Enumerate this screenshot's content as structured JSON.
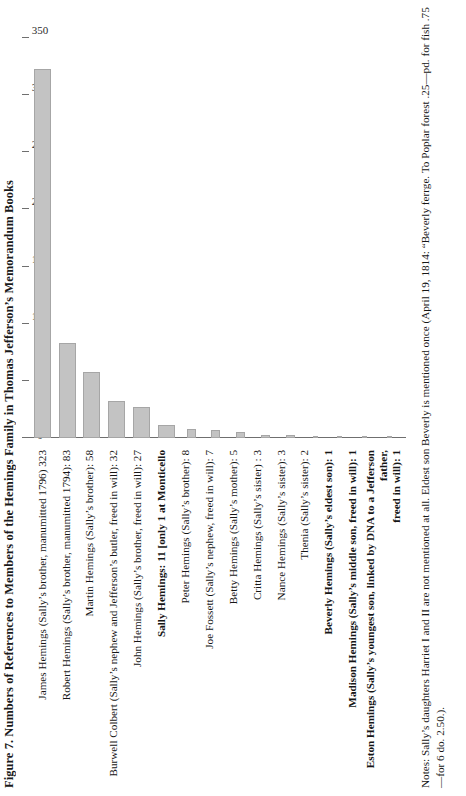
{
  "figure": {
    "title": "Figure 7. Numbers of References to Members of the Hemings Family in Thomas Jefferson’s Memorandum Books",
    "notes": "Notes: Sally’s daughters Harriet I and II are not mentioned at all. Eldest son Beverly is mentioned once (April 19, 1814: “Beverly ferrge. To Poplar forest .25—pd. for fish .75—for 6 do. 2.50.).",
    "bar_color": "#c3c3c3",
    "bar_border_color": "#a6a6a6",
    "axis_color": "#6f6f6f"
  },
  "chart_data": {
    "type": "bar",
    "orientation": "horizontal",
    "title": "Figure 7. Numbers of References to Members of the Hemings Family in Thomas Jefferson’s Memorandum Books",
    "xlabel": "",
    "ylabel": "",
    "xlim": [
      0,
      350
    ],
    "grid": false,
    "legend": false,
    "ticks": [
      0,
      50,
      100,
      150,
      200,
      250,
      300,
      350
    ],
    "categories": [
      "James Hemings (Sally’s brother, manumitted 1796)  323",
      "Robert Hemings (Sally’s brother, manumitted 1794): 83",
      "Martin Hemings (Sally’s brother): 58",
      "Burwell Colbert (Sally’s nephew and Jefferson’s butler, freed in will): 32",
      "John Hemings (Sally’s brother, freed in will): 27",
      "Sally Hemings: 11 [only 1 at Monticello",
      "Peter Hemings (Sally’s brother): 8",
      "Joe Fossett (Sally’s nephew, freed in will): 7",
      "Betty Hemings (Sally’s mother): 5",
      "Critta Hemings (Sally’s sister) : 3",
      "Nance Hemings (Sally’s sister): 3",
      "Thenia (Sally’s sister): 2",
      "Beverly Hemings (Sally’s eldest son): 1",
      "Madison Hemings (Sally’s middle son, freed in will): 1",
      "Eston Hemings (Sally’s youngest son, linked by DNA to a Jefferson father,\nfreed in will): 1"
    ],
    "values": [
      323,
      83,
      58,
      32,
      27,
      11,
      8,
      7,
      5,
      3,
      3,
      2,
      1,
      1,
      1
    ]
  }
}
